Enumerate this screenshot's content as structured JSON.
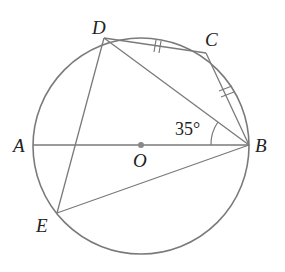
{
  "diagram": {
    "type": "circle-geometry",
    "labels": {
      "A": "A",
      "B": "B",
      "C": "C",
      "D": "D",
      "E": "E",
      "O": "O"
    },
    "angle_label": "35°",
    "colors": {
      "stroke": "#7a7a7a",
      "text": "#222222",
      "center_dot": "#888888"
    },
    "equal_marks": [
      "DC",
      "CB"
    ],
    "segments": [
      "AB",
      "DC",
      "CB",
      "DB",
      "DE",
      "EB"
    ]
  }
}
